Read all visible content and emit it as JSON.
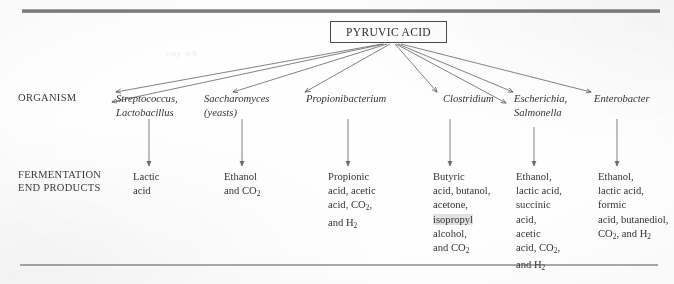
{
  "figure": {
    "source_title": "PYRUVIC ACID",
    "row_labels": {
      "organism": "ORGANISM",
      "products": "FERMENTATION\nEND PRODUCTS"
    }
  },
  "branches": [
    {
      "organism": "Streptococcus,\nLactobacillus",
      "products_plain": "Lactic\nacid",
      "products_html": "Lactic<br>acid"
    },
    {
      "organism": "Saccharomyces\n(yeasts)",
      "products_plain": "Ethanol\nand CO2",
      "products_html": "Ethanol<br>and CO<sub>2</sub>"
    },
    {
      "organism": "Propionibacterium",
      "products_plain": "Propionic\nacid, acetic\nacid, CO2,\nand H2",
      "products_html": "Propionic<br>acid, acetic<br>acid, CO<sub>2</sub>,<br>and H<sub>2</sub>"
    },
    {
      "organism": "Clostridium",
      "products_plain": "Butyric\nacid, butanol,\nacetone,\nisopropyl\nalcohol,\nand CO2",
      "products_html": "Butyric<br>acid, butanol,<br>acetone,<br><span class=\"hl\">isopropyl</span><br>alcohol,<br>and CO<sub>2</sub>"
    },
    {
      "organism": "Escherichia,\nSalmonella",
      "products_plain": "Ethanol,\nlactic acid,\nsuccinic\nacid,\nacetic\nacid, CO2,\nand H2",
      "products_html": "Ethanol,<br>lactic acid,<br>succinic<br>acid,<br>acetic<br>acid, CO<sub>2</sub>,<br>and H<sub>2</sub>"
    },
    {
      "organism": "Enterobacter",
      "products_plain": "Ethanol,\nlactic acid,\nformic\nacid, butanediol,\nCO2, and H2",
      "products_html": "Ethanol,<br>lactic acid,<br>formic<br>acid, butanediol,<br>CO<sub>2</sub>, and H<sub>2</sub>"
    }
  ],
  "colors": {
    "ink": "#333333",
    "rule": "#8d8d8d",
    "highlight": "#969696",
    "paper": "#fefefe"
  }
}
